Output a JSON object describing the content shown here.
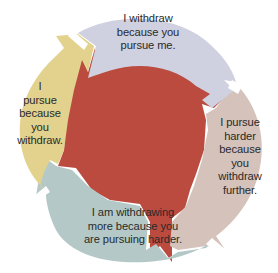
{
  "diagram": {
    "type": "cycle",
    "colors": {
      "center": "#bb4b3f",
      "top_segment": "#cfd0e0",
      "right_segment": "#d4c2bb",
      "bottom_segment": "#b4c9c7",
      "left_segment": "#e2d28e",
      "text": "#2a2a2a",
      "background": "#ffffff"
    },
    "segments": [
      {
        "id": "top",
        "label": "I withdraw\nbecause you\npursue me."
      },
      {
        "id": "right",
        "label": "I pursue\nharder\nbecause\nyou\nwithdraw\nfurther."
      },
      {
        "id": "bottom",
        "label": "I am withdrawing\nmore because you\nare pursuing harder."
      },
      {
        "id": "left",
        "label": "I\npursue\nbecause\nyou\nwithdraw."
      }
    ]
  }
}
